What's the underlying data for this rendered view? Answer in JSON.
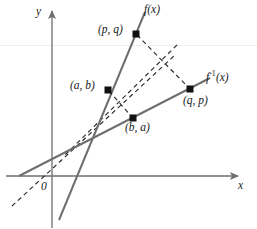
{
  "figure": {
    "background_color": "#ffffff",
    "line_color": "#6e6e6e",
    "dash_color": "#2b2b2b",
    "text_color": "#1a1a1a",
    "point_color": "#111111",
    "axes": {
      "x_label": "x",
      "y_label": "y",
      "origin_label": "0",
      "x_axis_y_px": 176,
      "y_axis_x_px": 52,
      "x_axis_from_px": 6,
      "x_axis_to_px": 240,
      "y_axis_from_px": 228,
      "y_axis_to_px": 9
    },
    "curves": [
      {
        "name": "f",
        "label": "f(x)",
        "style": "solid",
        "points_px": [
          [
            59,
            219
          ],
          [
            145,
            12
          ]
        ]
      },
      {
        "name": "f-inverse",
        "label": "f",
        "label_sup": "-1",
        "label_tail": "(x)",
        "style": "solid",
        "points_px": [
          [
            20,
            176
          ],
          [
            209,
            79
          ]
        ]
      },
      {
        "name": "identity-line",
        "label": "y = x",
        "style": "dashed",
        "points_px": [
          [
            12,
            206
          ],
          [
            174,
            56
          ]
        ]
      },
      {
        "name": "reflection-axis-perp",
        "label": "",
        "style": "dashed",
        "points_px": [
          [
            176,
            46
          ],
          [
            64,
            156
          ]
        ]
      }
    ],
    "connectors": [
      {
        "name": "pq-to-qp",
        "style": "dashed",
        "points_px": [
          [
            136,
            34
          ],
          [
            190,
            89
          ]
        ]
      },
      {
        "name": "ab-to-ba",
        "style": "dashed",
        "points_px": [
          [
            108,
            90
          ],
          [
            133,
            118
          ]
        ]
      }
    ],
    "points": [
      {
        "id": "pq",
        "label": "(p, q)",
        "x_px": 136,
        "y_px": 34,
        "label_x_px": 98,
        "label_y_px": 26,
        "label_anchor": "left"
      },
      {
        "id": "ab",
        "label": "(a, b)",
        "x_px": 108,
        "y_px": 90,
        "label_x_px": 70,
        "label_y_px": 82,
        "label_anchor": "left"
      },
      {
        "id": "ba",
        "label": "(b, a)",
        "x_px": 133,
        "y_px": 118,
        "label_x_px": 124,
        "label_y_px": 122,
        "label_anchor": "left"
      },
      {
        "id": "qp",
        "label": "(q, p)",
        "x_px": 190,
        "y_px": 89,
        "label_x_px": 182,
        "label_y_px": 94,
        "label_anchor": "left"
      }
    ],
    "curve_labels": {
      "f_label": "f(x)",
      "f_label_x_px": 144,
      "f_label_y_px": 5,
      "finv_base": "f",
      "finv_sup": "-1",
      "finv_tail": "(x)",
      "finv_label_x_px": 206,
      "finv_label_y_px": 70
    }
  }
}
